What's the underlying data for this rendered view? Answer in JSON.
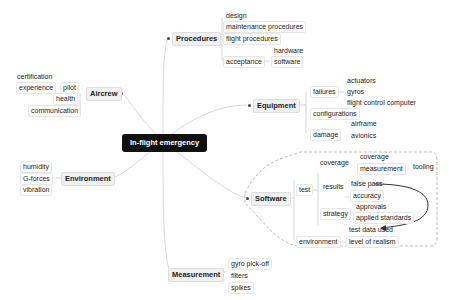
{
  "root": "In-flight emergency",
  "branches": {
    "procedures": {
      "label": "Procedures",
      "children": [
        "design",
        "maintenance procedures",
        "flight procedures",
        "acceptance"
      ],
      "acceptance_children": [
        "hardware",
        "software"
      ]
    },
    "aircrew": {
      "label": "Aircrew",
      "children": [
        "pilot",
        "health",
        "communication"
      ],
      "pilot_children": [
        "certification",
        "experience"
      ]
    },
    "equipment": {
      "label": "Equipment",
      "children": [
        "failures",
        "configurations",
        "damage"
      ],
      "failures_children": [
        "actuators",
        "gyros",
        "flight control computer"
      ],
      "damage_children": [
        "airframe",
        "avionics"
      ]
    },
    "environment": {
      "label": "Environment",
      "children": [
        "humidity",
        "G-forces",
        "vibration"
      ]
    },
    "software": {
      "label": "Software",
      "test": "test",
      "test_children": [
        "coverage",
        "results",
        "strategy",
        "test data used"
      ],
      "coverage_children": [
        "coverage",
        "measurement"
      ],
      "measurement_child": "tooling",
      "results_children": [
        "false pass",
        "accuracy"
      ],
      "strategy_children": [
        "approvals",
        "applied standards"
      ],
      "environment": "environment",
      "environment_child": "level of realism"
    },
    "measurement": {
      "label": "Measurement",
      "children": [
        "gyro pick-off",
        "filters",
        "spikes"
      ]
    }
  }
}
